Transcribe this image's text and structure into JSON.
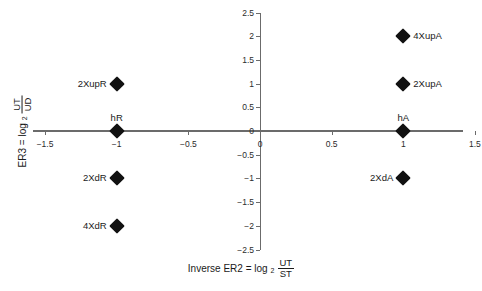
{
  "chart_data": {
    "type": "scatter",
    "title": "",
    "xlabel": "Inverse ER2 = log2 UT/ST",
    "ylabel": "ER3 = log2 UT/UD",
    "xlim": [
      -1.5,
      1.5
    ],
    "ylim": [
      -2.5,
      2.5
    ],
    "grid": false,
    "legend": "none",
    "x_ticks": [
      -1.5,
      -1,
      -0.5,
      0,
      0.5,
      1,
      1.5
    ],
    "x_tick_labels": [
      "−1.5",
      "−1",
      "−0.5",
      "0",
      "0.5",
      "1",
      "1.5"
    ],
    "y_ticks": [
      2.5,
      2,
      1.5,
      1,
      0.5,
      0,
      -0.5,
      -1,
      -1.5,
      -2,
      -2.5
    ],
    "y_tick_labels": [
      "2.5",
      "2",
      "1.5",
      "1",
      "0.5",
      "0",
      "−0.5",
      "−1",
      "−1.5",
      "−2",
      "−2.5"
    ],
    "marker": "diamond",
    "marker_color": "#111111",
    "points": [
      {
        "label": "4XupA",
        "x": 1,
        "y": 2,
        "label_position": "right"
      },
      {
        "label": "2XupA",
        "x": 1,
        "y": 1,
        "label_position": "right"
      },
      {
        "label": "2XupR",
        "x": -1,
        "y": 1,
        "label_position": "left"
      },
      {
        "label": "hR",
        "x": -1,
        "y": 0,
        "label_position": "above"
      },
      {
        "label": "hA",
        "x": 1,
        "y": 0,
        "label_position": "above"
      },
      {
        "label": "2XdR",
        "x": -1,
        "y": -1,
        "label_position": "left"
      },
      {
        "label": "2XdA",
        "x": 1,
        "y": -1,
        "label_position": "left"
      },
      {
        "label": "4XdR",
        "x": -1,
        "y": -2,
        "label_position": "left"
      }
    ]
  },
  "axis_titles": {
    "x": {
      "prefix": "Inverse ER2 = log",
      "subscript": "2",
      "numerator": "UT",
      "denominator": "ST"
    },
    "y": {
      "prefix": "ER3 = log",
      "subscript": "2",
      "numerator": "UT",
      "denominator": "UD"
    }
  }
}
